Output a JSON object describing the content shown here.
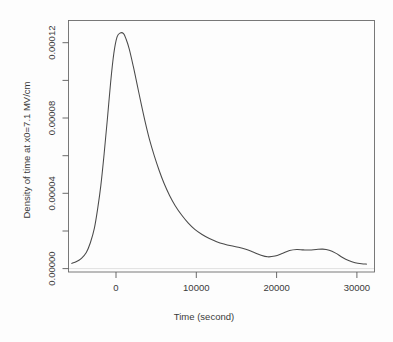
{
  "chart_data": {
    "type": "line",
    "title": "",
    "xlabel": "Time (second)",
    "ylabel": "Density of time at x0=7.1 MV/cm",
    "xlim": [
      -5600,
      32200
    ],
    "ylim": [
      -3.5e-06,
      0.000134
    ],
    "grid": false,
    "legend": "none",
    "xticks": [
      0,
      10000,
      20000,
      30000
    ],
    "xtick_labels": [
      "0",
      "10000",
      "20000",
      "30000"
    ],
    "yticks": [
      0.0,
      2e-05,
      4e-05,
      6e-05,
      8e-05,
      0.0001,
      0.00012
    ],
    "ytick_labels": [
      "0.00000",
      "",
      "0.00004",
      "",
      "0.00008",
      "",
      "0.00012"
    ],
    "ytick_labeled": [
      0.0,
      4e-05,
      8e-05,
      0.00012
    ],
    "series": [
      {
        "name": "density",
        "x": [
          -5200,
          -4600,
          -4000,
          -3400,
          -2900,
          -2400,
          -2000,
          -1600,
          -1200,
          -800,
          -400,
          0,
          400,
          800,
          1200,
          1500,
          1900,
          2400,
          2900,
          3400,
          3900,
          4400,
          5000,
          5600,
          6200,
          6900,
          7600,
          8400,
          9200,
          10000,
          10900,
          11800,
          12700,
          13600,
          14500,
          15400,
          16300,
          17200,
          18100,
          19000,
          19900,
          20800,
          21700,
          22600,
          23400,
          24200,
          25000,
          25800,
          26600,
          27400,
          28200,
          29000,
          29800,
          30600,
          31200
        ],
        "y": [
          1.2e-06,
          2.2e-06,
          4e-06,
          7.2e-06,
          1.25e-05,
          2.05e-05,
          3.1e-05,
          4.4e-05,
          6.1e-05,
          8e-05,
          0.0001,
          0.000116,
          0.000125,
          0.0001272,
          0.0001268,
          0.000124,
          0.0001185,
          0.000109,
          9.85e-05,
          8.8e-05,
          7.8e-05,
          6.9e-05,
          6e-05,
          5.2e-05,
          4.5e-05,
          3.82e-05,
          3.26e-05,
          2.75e-05,
          2.32e-05,
          1.98e-05,
          1.7e-05,
          1.48e-05,
          1.31e-05,
          1.18e-05,
          1.08e-05,
          1e-05,
          8.9e-06,
          7.4e-06,
          5.8e-06,
          4.8e-06,
          5.2e-06,
          6.6e-06,
          8.2e-06,
          8.8e-06,
          8.6e-06,
          8.5e-06,
          8.8e-06,
          9e-06,
          8.4e-06,
          6.8e-06,
          4.6e-06,
          2.8e-06,
          1.6e-06,
          1e-06,
          8e-07
        ]
      }
    ],
    "peak": {
      "x": 900,
      "y": 0.0001272
    },
    "colors": {
      "curve": "#4a4a4a",
      "axis": "#5a5a5a",
      "background": "#fdfdfd"
    }
  },
  "axes": {
    "x_title": "Time (second)",
    "y_title": "Density of time at x0=7.1 MV/cm",
    "x_tick_labels": [
      "0",
      "10000",
      "20000",
      "30000"
    ],
    "y_tick_labels": [
      "0.00000",
      "0.00004",
      "0.00008",
      "0.00012"
    ]
  }
}
